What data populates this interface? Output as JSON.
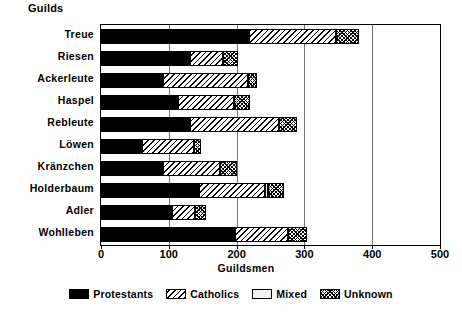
{
  "chart_data": {
    "type": "bar",
    "orientation": "horizontal",
    "stacked": true,
    "title": "Guilds",
    "xlabel": "Guildsmen",
    "ylabel": "Guilds",
    "xlim": [
      0,
      500
    ],
    "xticks": [
      0,
      100,
      200,
      300,
      400,
      500
    ],
    "grid": true,
    "legend_position": "bottom",
    "categories": [
      "Treue",
      "Riesen",
      "Ackerleute",
      "Haspel",
      "Rebleute",
      "Löwen",
      "Kränzchen",
      "Holderbaum",
      "Adler",
      "Wohlleben"
    ],
    "series": [
      {
        "name": "Protestants",
        "fill": "solid-black",
        "values": [
          218,
          132,
          91,
          113,
          132,
          60,
          91,
          145,
          104,
          198
        ]
      },
      {
        "name": "Catholics",
        "fill": "diagonal-hatch",
        "values": [
          128,
          48,
          126,
          83,
          131,
          77,
          85,
          97,
          35,
          78
        ]
      },
      {
        "name": "Mixed",
        "fill": "light-solid",
        "values": [
          0,
          0,
          0,
          0,
          0,
          0,
          0,
          4,
          0,
          0
        ]
      },
      {
        "name": "Unknown",
        "fill": "cross-hatch",
        "values": [
          35,
          22,
          13,
          24,
          26,
          11,
          25,
          24,
          16,
          28
        ]
      }
    ],
    "totals": [
      381,
      202,
      230,
      220,
      289,
      148,
      201,
      270,
      155,
      304
    ]
  },
  "legend": {
    "items": [
      {
        "label": "Protestants",
        "swatch": "solid-black-swatch"
      },
      {
        "label": "Catholics",
        "swatch": "diagonal-hatch-swatch"
      },
      {
        "label": "Mixed",
        "swatch": "light-solid-swatch"
      },
      {
        "label": "Unknown",
        "swatch": "cross-hatch-swatch"
      }
    ]
  },
  "colors": {
    "foreground": "#000000",
    "background": "#ffffff",
    "mixed_fill": "#f2f2f2"
  }
}
